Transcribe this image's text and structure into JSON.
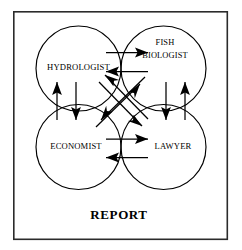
{
  "diagram": {
    "title_label": "REPORT",
    "frame": {
      "x": 13,
      "y": 11,
      "width": 215,
      "height": 229
    },
    "nodes": [
      {
        "id": "hydrologist",
        "label": "HYDROLOGIST",
        "lines": [
          "HYDROLOGIST"
        ],
        "cx": 78.5,
        "cy": 68.5,
        "r": 42.5
      },
      {
        "id": "fish-biologist",
        "label": "FISH BIOLOGIST",
        "lines": [
          "FISH",
          "BIOLOGIST"
        ],
        "cx": 163.5,
        "cy": 68.5,
        "r": 42.5
      },
      {
        "id": "economist",
        "label": "ECONOMIST",
        "lines": [
          "ECONOMIST"
        ],
        "cx": 78.5,
        "cy": 147.0,
        "r": 42.5
      },
      {
        "id": "lawyer",
        "label": "LAWYER",
        "lines": [
          "LAWYER"
        ],
        "cx": 163.5,
        "cy": 147.0,
        "r": 42.5
      }
    ],
    "edges": [
      {
        "id": "hydrologist-to-fish-biologist",
        "from": "hydrologist",
        "to": "fish-biologist",
        "direction": "right"
      },
      {
        "id": "fish-biologist-to-hydrologist",
        "from": "fish-biologist",
        "to": "hydrologist",
        "direction": "left"
      },
      {
        "id": "economist-to-lawyer",
        "from": "economist",
        "to": "lawyer",
        "direction": "right"
      },
      {
        "id": "lawyer-to-economist",
        "from": "lawyer",
        "to": "economist",
        "direction": "left"
      },
      {
        "id": "economist-to-hydrologist",
        "from": "economist",
        "to": "hydrologist",
        "direction": "up"
      },
      {
        "id": "hydrologist-to-economist",
        "from": "hydrologist",
        "to": "economist",
        "direction": "down"
      },
      {
        "id": "lawyer-to-fish-biologist",
        "from": "lawyer",
        "to": "fish-biologist",
        "direction": "up"
      },
      {
        "id": "fish-biologist-to-lawyer",
        "from": "fish-biologist",
        "to": "lawyer",
        "direction": "down"
      },
      {
        "id": "hydrologist-to-lawyer",
        "from": "hydrologist",
        "to": "lawyer",
        "direction": "down-right"
      },
      {
        "id": "lawyer-to-hydrologist",
        "from": "lawyer",
        "to": "hydrologist",
        "direction": "up-left"
      },
      {
        "id": "fish-biologist-to-economist",
        "from": "fish-biologist",
        "to": "economist",
        "direction": "down-left"
      },
      {
        "id": "economist-to-fish-biologist",
        "from": "economist",
        "to": "fish-biologist",
        "direction": "up-right"
      }
    ],
    "colors": {
      "stroke": "#000000",
      "frame": "#2b2b2b",
      "background": "#ffffff"
    }
  }
}
